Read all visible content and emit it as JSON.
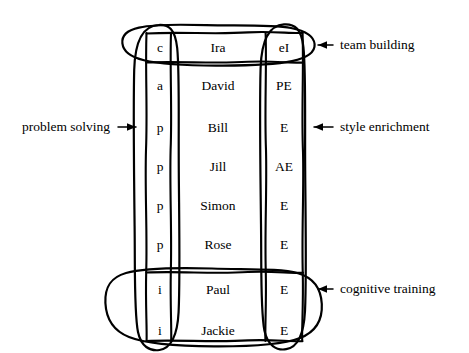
{
  "figure": {
    "type": "annotated-table-diagram",
    "style": "hand-drawn",
    "ink_color": "#000000",
    "background_color": "#ffffff"
  },
  "table": {
    "columns": [
      "code",
      "name",
      "tag"
    ],
    "rows": [
      {
        "code": "c",
        "name": "Ira",
        "tag": "eI"
      },
      {
        "code": "a",
        "name": "David",
        "tag": "PE"
      },
      {
        "code": "p",
        "name": "Bill",
        "tag": "E"
      },
      {
        "code": "p",
        "name": "Jill",
        "tag": "AE"
      },
      {
        "code": "p",
        "name": "Simon",
        "tag": "E"
      },
      {
        "code": "p",
        "name": "Rose",
        "tag": "E"
      },
      {
        "code": "i",
        "name": "Paul",
        "tag": "E"
      },
      {
        "code": "i",
        "name": "Jackie",
        "tag": "E"
      }
    ]
  },
  "groupings": [
    {
      "id": "top-row-group",
      "shape": "ellipse",
      "covers": "row 1 across all columns"
    },
    {
      "id": "code-column-group",
      "shape": "ellipse",
      "covers": "code column, all rows"
    },
    {
      "id": "tag-column-group",
      "shape": "ellipse",
      "covers": "tag column, all rows"
    },
    {
      "id": "bottom-rows-group",
      "shape": "ellipse",
      "covers": "rows 7-8 across all columns"
    }
  ],
  "annotations": [
    {
      "id": "team-building",
      "label": "team building",
      "side": "right",
      "arrow": "left"
    },
    {
      "id": "style-enrichment",
      "label": "style enrichment",
      "side": "right",
      "arrow": "left"
    },
    {
      "id": "cognitive-training",
      "label": "cognitive training",
      "side": "right",
      "arrow": "left"
    },
    {
      "id": "problem-solving",
      "label": "problem solving",
      "side": "left",
      "arrow": "right"
    }
  ]
}
